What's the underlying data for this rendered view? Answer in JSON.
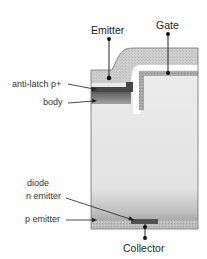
{
  "diagram": {
    "type": "semiconductor-cross-section",
    "terminals": {
      "emitter": "Emitter",
      "gate": "Gate",
      "collector": "Collector"
    },
    "regions": {
      "anti_latch": "anti-latch p+",
      "body": "body",
      "diode_line1": "diode",
      "diode_line2": "n emitter",
      "p_emitter": "p emitter"
    },
    "colors": {
      "outline": "#6e6e6e",
      "emitter_metal": "#c8c8c8",
      "gate_poly": "#a6a6a6",
      "oxide": "#ffffff",
      "anti_latch_p_plus": "#4a4a4a",
      "body_top": "#6a6a6a",
      "body_bottom": "#9a9a9a",
      "drift": "#e4e4e4",
      "p_emitter": "#b4b4b4",
      "diode_n_emitter": "#555555",
      "leader": "#333333",
      "text": "#333333"
    }
  }
}
